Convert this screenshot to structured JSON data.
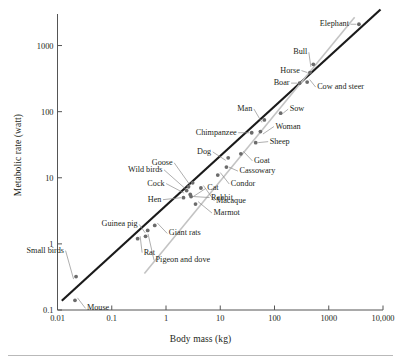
{
  "figure": {
    "bottom_rule": true
  },
  "chart_data": {
    "type": "scatter",
    "title": "",
    "xlabel": "Body mass (kg)",
    "ylabel": "Metabolic rate (watt)",
    "xscale": "log",
    "yscale": "log",
    "xlim": [
      0.01,
      10000
    ],
    "ylim": [
      0.1,
      3000
    ],
    "grid": false,
    "legend": "none",
    "xticks": [
      0.01,
      0.1,
      1,
      10,
      100,
      1000,
      10000
    ],
    "xticklabels": [
      "0.01",
      "0.1",
      "1",
      "10",
      "100",
      "1000",
      "10,000"
    ],
    "yticks": [
      0.1,
      1,
      10,
      100,
      1000
    ],
    "yticklabels": [
      "0.1",
      "1",
      "10",
      "100",
      "1000"
    ],
    "marker_color": "#6b6b6b",
    "line_color": "#1a1a1a",
    "reference_line_color": "#c3c3c3",
    "points": [
      {
        "name": "Mouse",
        "x": 0.021,
        "y": 0.14,
        "label_pos": "right"
      },
      {
        "name": "Small birds",
        "x": 0.022,
        "y": 0.32,
        "label_pos": "upleft"
      },
      {
        "name": "Rat",
        "x": 0.3,
        "y": 1.2,
        "label_pos": "below"
      },
      {
        "name": "Guinea pig",
        "x": 0.46,
        "y": 1.6,
        "label_pos": "left"
      },
      {
        "name": "Giant rats",
        "x": 0.62,
        "y": 1.9,
        "label_pos": "right"
      },
      {
        "name": "Pigeon and dove",
        "x": 0.42,
        "y": 1.3,
        "label_pos": "below"
      },
      {
        "name": "Hen",
        "x": 2.1,
        "y": 5.0,
        "label_pos": "left"
      },
      {
        "name": "Cock",
        "x": 2.4,
        "y": 6.4,
        "label_pos": "left"
      },
      {
        "name": "Wild birds",
        "x": 2.6,
        "y": 7.3,
        "label_pos": "upleft"
      },
      {
        "name": "Goose",
        "x": 3.1,
        "y": 8.4,
        "label_pos": "upleft"
      },
      {
        "name": "Marmot",
        "x": 3.5,
        "y": 4.0,
        "label_pos": "right"
      },
      {
        "name": "Rabbit",
        "x": 2.9,
        "y": 5.2,
        "label_pos": "right"
      },
      {
        "name": "Cat",
        "x": 2.8,
        "y": 5.6,
        "label_pos": "right"
      },
      {
        "name": "Macaque",
        "x": 4.4,
        "y": 7.0,
        "label_pos": "right"
      },
      {
        "name": "Condor",
        "x": 9.0,
        "y": 11.0,
        "label_pos": "right"
      },
      {
        "name": "Cassowary",
        "x": 13.0,
        "y": 14.5,
        "label_pos": "right"
      },
      {
        "name": "Dog",
        "x": 14.0,
        "y": 20.0,
        "label_pos": "left"
      },
      {
        "name": "Goat",
        "x": 24.0,
        "y": 23.0,
        "label_pos": "right"
      },
      {
        "name": "Sheep",
        "x": 45.0,
        "y": 34.0,
        "label_pos": "right"
      },
      {
        "name": "Chimpanzee",
        "x": 38.0,
        "y": 48.0,
        "label_pos": "left"
      },
      {
        "name": "Woman",
        "x": 55.0,
        "y": 50.0,
        "label_pos": "right"
      },
      {
        "name": "Man",
        "x": 65.0,
        "y": 75.0,
        "label_pos": "upleft"
      },
      {
        "name": "Sow",
        "x": 130.0,
        "y": 95.0,
        "label_pos": "right"
      },
      {
        "name": "Boar",
        "x": 290.0,
        "y": 270.0,
        "label_pos": "left"
      },
      {
        "name": "Cow and steer",
        "x": 400.0,
        "y": 280.0,
        "label_pos": "right"
      },
      {
        "name": "Horse",
        "x": 450.0,
        "y": 390.0,
        "label_pos": "left"
      },
      {
        "name": "Bull",
        "x": 520.0,
        "y": 520.0,
        "label_pos": "upleft"
      },
      {
        "name": "Elephant",
        "x": 3600.0,
        "y": 2100.0,
        "label_pos": "left"
      }
    ],
    "series_lines": [
      {
        "name": "Kleiber 3/4-power fit",
        "slope": 0.75,
        "color": "#1a1a1a",
        "width": 2.2,
        "x_start": 0.012,
        "x_end": 9000
      },
      {
        "name": "isometric (slope 1) reference",
        "slope": 1.0,
        "color": "#c3c3c3",
        "width": 1.6,
        "x_start": 0.4,
        "x_end": 3000
      }
    ]
  }
}
